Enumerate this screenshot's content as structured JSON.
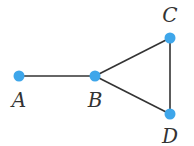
{
  "graph": {
    "node_color": "#3ea6ea",
    "edge_color": "#333333",
    "nodes": [
      {
        "id": "A",
        "label": "A",
        "x": 19,
        "y": 76,
        "lx": 19,
        "ly": 107
      },
      {
        "id": "B",
        "label": "B",
        "x": 95,
        "y": 76,
        "lx": 95,
        "ly": 107
      },
      {
        "id": "C",
        "label": "C",
        "x": 170,
        "y": 38,
        "lx": 170,
        "ly": 22
      },
      {
        "id": "D",
        "label": "D",
        "x": 170,
        "y": 114,
        "lx": 170,
        "ly": 143
      }
    ],
    "edges": [
      [
        "A",
        "B"
      ],
      [
        "B",
        "C"
      ],
      [
        "B",
        "D"
      ],
      [
        "C",
        "D"
      ]
    ]
  }
}
